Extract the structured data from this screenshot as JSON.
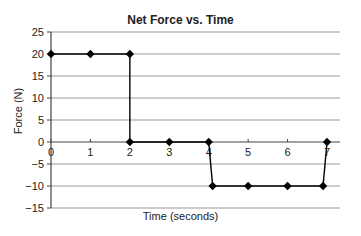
{
  "chart_data": {
    "type": "line",
    "title": "Net Force vs. Time",
    "xlabel": "Time (seconds)",
    "ylabel": "Force (N)",
    "xlim": [
      0,
      7
    ],
    "ylim": [
      -15,
      25
    ],
    "x_ticks": [
      0,
      1,
      2,
      3,
      4,
      5,
      6,
      7
    ],
    "y_ticks": [
      25,
      20,
      15,
      10,
      5,
      0,
      -5,
      -10,
      -15
    ],
    "grid": "horizontal",
    "legend": null,
    "series": [
      {
        "name": "Net Force",
        "marker": "diamond",
        "color": "#000000",
        "points": [
          {
            "x": 0,
            "y": 20
          },
          {
            "x": 1,
            "y": 20
          },
          {
            "x": 2,
            "y": 20
          },
          {
            "x": 2,
            "y": 0
          },
          {
            "x": 3,
            "y": 0
          },
          {
            "x": 4,
            "y": 0
          },
          {
            "x": 4.1,
            "y": -10
          },
          {
            "x": 5,
            "y": -10
          },
          {
            "x": 6,
            "y": -10
          },
          {
            "x": 6.9,
            "y": -10
          },
          {
            "x": 7,
            "y": 0
          }
        ]
      }
    ]
  },
  "colors": {
    "grid": "#9a9a9a",
    "axis": "#444444",
    "line": "#000000"
  }
}
